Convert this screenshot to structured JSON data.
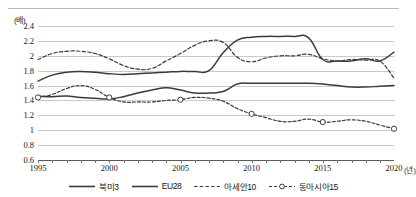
{
  "figure": {
    "unit_label": "(배)",
    "x_axis_unit": "(년)"
  },
  "chart_data": {
    "type": "line",
    "title": "",
    "xlabel": "(년)",
    "ylabel": "(배)",
    "xlim": [
      1995,
      2020
    ],
    "ylim": [
      0.6,
      2.4
    ],
    "yticks": [
      "2.4",
      "2.2",
      "2",
      "1.8",
      "1.6",
      "1.4",
      "1.2",
      "1",
      "0.8",
      "0.6"
    ],
    "ytick_values": [
      2.4,
      2.2,
      2.0,
      1.8,
      1.6,
      1.4,
      1.2,
      1.0,
      0.8,
      0.6
    ],
    "xticks": [
      1995,
      2000,
      2005,
      2010,
      2015,
      2020
    ],
    "xtick_labels": [
      "1995",
      "2000",
      "2005",
      "2010",
      "2015",
      "2020"
    ],
    "grid": true,
    "legend_position": "bottom",
    "x": [
      1995,
      1996,
      1997,
      1998,
      1999,
      2000,
      2001,
      2002,
      2003,
      2004,
      2005,
      2006,
      2007,
      2008,
      2009,
      2010,
      2011,
      2012,
      2013,
      2014,
      2015,
      2016,
      2017,
      2018,
      2019,
      2020
    ],
    "series": [
      {
        "name": "북미3",
        "style": "solid",
        "color": "#3b3b3b",
        "markers": false,
        "values": [
          1.66,
          1.74,
          1.78,
          1.79,
          1.78,
          1.76,
          1.75,
          1.76,
          1.77,
          1.78,
          1.79,
          1.79,
          1.8,
          2.04,
          2.21,
          2.25,
          2.26,
          2.26,
          2.26,
          2.24,
          1.95,
          1.93,
          1.93,
          1.96,
          1.93,
          2.05
        ]
      },
      {
        "name": "EU28",
        "style": "solid",
        "color": "#3b3b3b",
        "markers": false,
        "values": [
          1.46,
          1.45,
          1.46,
          1.44,
          1.43,
          1.42,
          1.45,
          1.5,
          1.54,
          1.57,
          1.54,
          1.5,
          1.5,
          1.52,
          1.62,
          1.63,
          1.63,
          1.63,
          1.63,
          1.63,
          1.62,
          1.6,
          1.58,
          1.58,
          1.59,
          1.6
        ]
      },
      {
        "name": "아세안10",
        "style": "dashed",
        "color": "#3b3b3b",
        "markers": false,
        "values": [
          1.95,
          2.03,
          2.06,
          2.06,
          2.03,
          1.96,
          1.87,
          1.82,
          1.83,
          1.93,
          2.03,
          2.14,
          2.2,
          2.18,
          1.98,
          1.92,
          1.97,
          2.0,
          2.0,
          2.02,
          1.96,
          1.93,
          1.95,
          1.94,
          1.93,
          1.7
        ]
      },
      {
        "name": "동아시아15",
        "style": "dash-dot-marker",
        "color": "#3b3b3b",
        "markers": true,
        "values": [
          1.44,
          1.48,
          1.56,
          1.6,
          1.55,
          1.44,
          1.38,
          1.38,
          1.38,
          1.4,
          1.41,
          1.44,
          1.43,
          1.39,
          1.29,
          1.22,
          1.17,
          1.12,
          1.12,
          1.15,
          1.11,
          1.12,
          1.14,
          1.12,
          1.07,
          1.02
        ]
      }
    ]
  },
  "legend": {
    "items": [
      {
        "label": "북미3",
        "style": "solid"
      },
      {
        "label": "EU28",
        "style": "solid"
      },
      {
        "label": "아세안10",
        "style": "dashed"
      },
      {
        "label": "동아시아15",
        "style": "dash-dot-marker"
      }
    ]
  }
}
